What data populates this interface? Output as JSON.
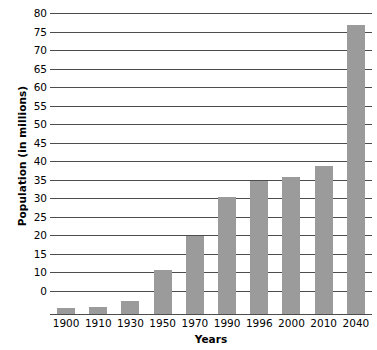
{
  "chart_data": {
    "type": "bar",
    "title": "",
    "xlabel": "Years",
    "ylabel": "Population (in millions)",
    "categories": [
      "1900",
      "1910",
      "1930",
      "1950",
      "1970",
      "1990",
      "1996",
      "2000",
      "2010",
      "2040"
    ],
    "values": [
      1.5,
      2,
      3.5,
      12,
      21,
      31.5,
      36,
      37,
      40,
      78
    ],
    "series": [
      {
        "name": "Population",
        "values": [
          1.5,
          2,
          3.5,
          12,
          21,
          31.5,
          36,
          37,
          40,
          78
        ]
      }
    ],
    "ylim": [
      0,
      80
    ],
    "ytick_labels": [
      "80",
      "75",
      "70",
      "65",
      "60",
      "55",
      "50",
      "45",
      "40",
      "35",
      "30",
      "25",
      "20",
      "15",
      "10",
      "0"
    ],
    "ytick_values": [
      80,
      75,
      70,
      65,
      60,
      55,
      50,
      45,
      40,
      35,
      30,
      25,
      20,
      15,
      10,
      5
    ],
    "grid": true,
    "legend": "none",
    "bar_color": "#9b9b9b",
    "grid_color": "#4d4d4d",
    "background_color": "#ffffff",
    "text_color": "#000000"
  }
}
